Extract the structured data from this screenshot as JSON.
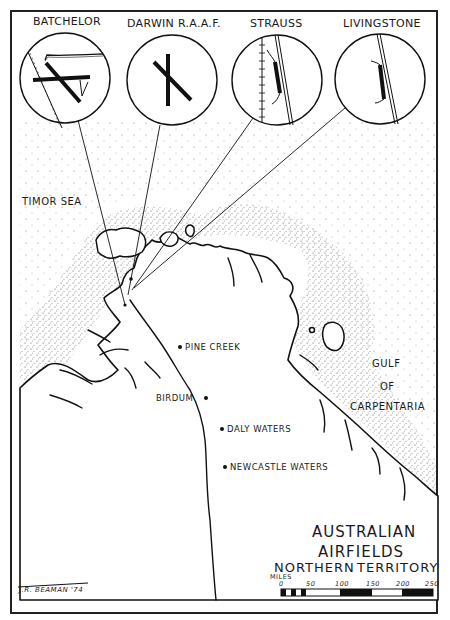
{
  "map": {
    "title_line1": "AUSTRALIAN",
    "title_line2": "AIRFIELDS",
    "title_line3": "NORTHERN",
    "title_line4": "TERRITORY",
    "signature": "J.R. BEAMAN '74"
  },
  "insets": [
    {
      "name": "BATCHELOR"
    },
    {
      "name": "DARWIN R.A.A.F."
    },
    {
      "name": "STRAUSS"
    },
    {
      "name": "LIVINGSTONE"
    }
  ],
  "water_labels": {
    "timor_sea": "TIMOR SEA",
    "gulf_line1": "GULF",
    "gulf_line2": "OF",
    "gulf_line3": "CARPENTARIA"
  },
  "towns": [
    {
      "name": "PINE CREEK"
    },
    {
      "name": "BIRDUM"
    },
    {
      "name": "DALY WATERS"
    },
    {
      "name": "NEWCASTLE WATERS"
    }
  ],
  "scale": {
    "unit": "MILES",
    "ticks": [
      "0",
      "50",
      "100",
      "150",
      "200",
      "250"
    ]
  },
  "colors": {
    "ink": "#1a1a1a",
    "paper": "#ffffff"
  }
}
